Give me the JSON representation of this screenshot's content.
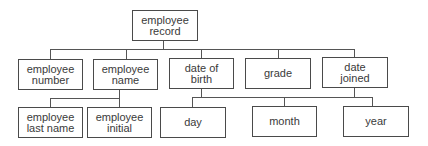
{
  "diagram": {
    "type": "hierarchy-tree",
    "root": {
      "label": "employee\nrecord",
      "box": {
        "x": 132,
        "y": 10,
        "w": 66,
        "h": 30
      }
    },
    "level1": [
      {
        "id": "employee-number",
        "label": "employee\nnumber",
        "box": {
          "x": 18,
          "y": 59,
          "w": 65,
          "h": 31
        },
        "stub_x": 50
      },
      {
        "id": "employee-name",
        "label": "employee\nname",
        "box": {
          "x": 93,
          "y": 59,
          "w": 65,
          "h": 30
        },
        "stub_x": 126
      },
      {
        "id": "date-of-birth",
        "label": "date of\nbirth",
        "box": {
          "x": 169,
          "y": 58,
          "w": 65,
          "h": 31
        },
        "stub_x": 201
      },
      {
        "id": "grade",
        "label": "grade",
        "box": {
          "x": 245,
          "y": 58,
          "w": 66,
          "h": 30
        },
        "stub_x": 278
      },
      {
        "id": "date-joined",
        "label": "date\njoined",
        "box": {
          "x": 322,
          "y": 57,
          "w": 66,
          "h": 31
        },
        "stub_x": 354
      }
    ],
    "level2_name": [
      {
        "id": "employee-last-name",
        "label": "employee\nlast name",
        "box": {
          "x": 18,
          "y": 107,
          "w": 65,
          "h": 31
        },
        "stub_x": 50
      },
      {
        "id": "employee-initial",
        "label": "employee\ninitial",
        "box": {
          "x": 87,
          "y": 107,
          "w": 65,
          "h": 30
        },
        "stub_x": 119
      }
    ],
    "level2_date": [
      {
        "id": "day",
        "label": "day",
        "box": {
          "x": 160,
          "y": 107,
          "w": 66,
          "h": 31
        },
        "stub_x": 192
      },
      {
        "id": "month",
        "label": "month",
        "box": {
          "x": 252,
          "y": 106,
          "w": 65,
          "h": 31
        },
        "stub_x": 284
      },
      {
        "id": "year",
        "label": "year",
        "box": {
          "x": 343,
          "y": 106,
          "w": 66,
          "h": 30
        },
        "stub_x": 372
      }
    ],
    "edges": [
      {
        "from": "employee record",
        "to": [
          "employee number",
          "employee name",
          "date of birth",
          "grade",
          "date joined"
        ]
      },
      {
        "from": "employee name",
        "to": [
          "employee last name",
          "employee initial"
        ]
      },
      {
        "from": "date of birth",
        "to": [
          "day",
          "month",
          "year"
        ]
      },
      {
        "from": "date joined",
        "to": [
          "day",
          "month",
          "year"
        ]
      }
    ],
    "colors": {
      "line": "#555555",
      "border": "#4a4a4a",
      "text": "#3a3a3a",
      "background": "#ffffff"
    }
  }
}
